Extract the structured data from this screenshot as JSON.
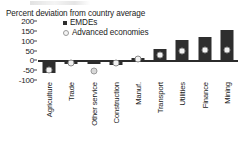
{
  "chart_data": {
    "type": "bar",
    "title": "Percent deviation from country average",
    "xlabel": "",
    "ylabel": "Percent deviation from country average",
    "ylim": [
      -100,
      200
    ],
    "yticks": [
      200,
      150,
      100,
      50,
      0,
      -50,
      -100
    ],
    "ytick_labels": [
      "200",
      "150",
      "100",
      "50",
      "0",
      "-50",
      "-100"
    ],
    "grid": false,
    "legend_position": "top-left-inside",
    "categories": [
      "Agriculture",
      "Trade",
      "Other service",
      "Construction",
      "Manuf.",
      "Transport",
      "Utilities",
      "Finance",
      "Mining"
    ],
    "series": [
      {
        "name": "EMDEs",
        "type": "bar",
        "color": "#2e2e2e",
        "values": [
          -62,
          -18,
          -20,
          -22,
          10,
          57,
          103,
          118,
          155
        ]
      },
      {
        "name": "Advanced economies",
        "type": "marker",
        "color": "#f2f2f2",
        "values": [
          -48,
          -12,
          -52,
          -13,
          8,
          25,
          50,
          52,
          52
        ]
      }
    ]
  },
  "legend": {
    "items": [
      {
        "label": "EMDEs",
        "symbol": "square"
      },
      {
        "label": "Advanced economies",
        "symbol": "circle"
      }
    ]
  }
}
